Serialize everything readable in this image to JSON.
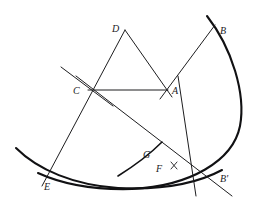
{
  "figure": {
    "background_color": "#ffffff",
    "line_color": "#1d1d1f",
    "arc_color": "#111113",
    "width": 260,
    "height": 210
  },
  "points": [
    {
      "id": "D",
      "label": "D",
      "x": 125,
      "y": 30,
      "label_x": 112,
      "label_y": 32
    },
    {
      "id": "B",
      "label": "B",
      "x": 215,
      "y": 25,
      "label_x": 220,
      "label_y": 34
    },
    {
      "id": "C",
      "label": "C",
      "x": 88,
      "y": 90,
      "label_x": 73,
      "label_y": 94
    },
    {
      "id": "A",
      "label": "A",
      "x": 168,
      "y": 90,
      "label_x": 172,
      "label_y": 94
    },
    {
      "id": "G",
      "label": "G",
      "x": 155,
      "y": 154,
      "label_x": 143,
      "label_y": 158
    },
    {
      "id": "F",
      "label": "F",
      "x": 168,
      "y": 168,
      "label_x": 156,
      "label_y": 172
    },
    {
      "id": "E",
      "label": "E",
      "x": 44,
      "y": 178,
      "label_x": 44,
      "label_y": 190
    },
    {
      "id": "Bp",
      "label": "B'",
      "x": 216,
      "y": 178,
      "label_x": 220,
      "label_y": 182
    }
  ],
  "segments": [
    {
      "name": "segment-D-E",
      "x1": 125,
      "y1": 30,
      "x2": 42,
      "y2": 186
    },
    {
      "name": "segment-D-A",
      "x1": 125,
      "y1": 30,
      "x2": 172,
      "y2": 97
    },
    {
      "name": "segment-C-A",
      "x1": 88,
      "y1": 90,
      "x2": 168,
      "y2": 90
    },
    {
      "name": "segment-A-B",
      "x1": 160,
      "y1": 99,
      "x2": 215,
      "y2": 25
    },
    {
      "name": "segment-upperleft-C",
      "x1": 61,
      "y1": 67,
      "x2": 113,
      "y2": 106
    },
    {
      "name": "segment-C-Bprime",
      "x1": 76,
      "y1": 76,
      "x2": 232,
      "y2": 196
    },
    {
      "name": "segment-A-lower",
      "x1": 178,
      "y1": 76,
      "x2": 196,
      "y2": 196
    }
  ],
  "arcs": [
    {
      "name": "arc-major-right",
      "description": "large arc from upper right sweeping down and left across the base",
      "path": "M 207 16 C 232 48 246 94 240 126 C 233 161 190 186 132 189 C 96 190 62 184 38 173"
    },
    {
      "name": "arc-lower-left",
      "description": "arc from the left edge sweeping through E along the bottom",
      "path": "M 16 148 C 38 170 74 185 118 188 C 160 190 196 184 222 170"
    },
    {
      "name": "arc-inner-small",
      "description": "small arc near G rising to the right",
      "path": "M 118 176 C 134 166 148 156 162 142"
    }
  ],
  "tick_marks": [
    {
      "name": "tick-at-F",
      "x1": 171,
      "y1": 162,
      "x2": 177,
      "y2": 169
    },
    {
      "name": "tick-at-F-cross",
      "x1": 177,
      "y1": 162,
      "x2": 171,
      "y2": 169
    }
  ]
}
